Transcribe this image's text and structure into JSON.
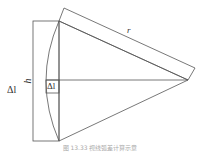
{
  "figure": {
    "labels": {
      "delta_l_outer": "Δl",
      "h": "h",
      "delta_l_inner": "Δl",
      "r": "r"
    },
    "caption": "图 13.33  视线弧差计算示意"
  },
  "colors": {
    "line": "#555555",
    "background": "#ffffff"
  }
}
